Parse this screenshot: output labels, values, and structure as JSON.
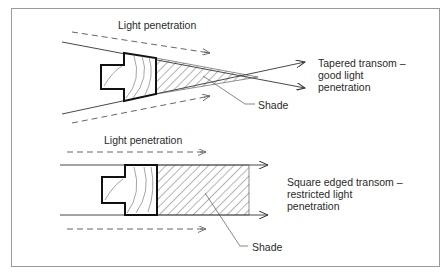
{
  "diagram": {
    "top": {
      "light_label": "Light penetration",
      "shade_label": "Shade",
      "caption": "Tapered transom –\ngood light\npenetration"
    },
    "bottom": {
      "light_label": "Light penetration",
      "shade_label": "Shade",
      "caption": "Square edged transom –\nrestricted light\npenetration"
    },
    "colors": {
      "line": "#333333",
      "profile": "#111111",
      "frame": "#9a9a9a"
    }
  }
}
